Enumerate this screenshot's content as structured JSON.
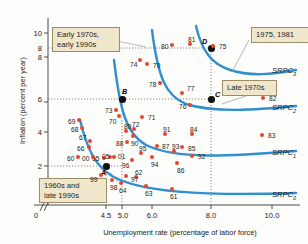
{
  "figure": {
    "title": "",
    "xaxis_title": "Unemployment rate (percentage of labor force)",
    "yaxis_title": "Inflation (percent per year)"
  },
  "callouts": [
    {
      "id": "early70s",
      "text": "Early 1970s,\nearly 1990s"
    },
    {
      "id": "years1975_1981",
      "text": "1975, 1981"
    },
    {
      "id": "late1970s",
      "text": "Late 1970s"
    },
    {
      "id": "sixties_late90s",
      "text": "1960s and\nlate 1990s"
    }
  ],
  "curve_labels": [
    {
      "name": "SRPC",
      "sub": "3"
    },
    {
      "name": "SRPC",
      "sub": "2"
    },
    {
      "name": "SRPC",
      "sub": "1"
    },
    {
      "name": "SRPC",
      "sub": "0"
    }
  ],
  "equilibrium_points": [
    {
      "label": "A",
      "x": 4.55,
      "y": 2.0
    },
    {
      "label": "B",
      "x": 5.0,
      "y": 6.1
    },
    {
      "label": "C",
      "x": 8.0,
      "y": 6.1
    },
    {
      "label": "D",
      "x": 8.0,
      "y": 8.2
    }
  ],
  "colors": {
    "point": "#e8452c",
    "curve": "#2f8fd0",
    "equilibrium": "#111111",
    "callout_bg": "#efe6cc",
    "callout_border": "#9c8f68"
  },
  "chart_data": {
    "type": "scatter",
    "title": "",
    "xlabel": "Unemployment rate (percentage of labor force)",
    "ylabel": "Inflation (percent per year)",
    "xlim": [
      4.0,
      10.6
    ],
    "ylim": [
      0.4,
      11.0
    ],
    "xticks": [
      "0",
      "4.5",
      "5.0",
      "6.0",
      "8.0",
      "10.0"
    ],
    "yticks": [
      "2",
      "4",
      "6",
      "8",
      "10"
    ],
    "grid": false,
    "axis_break": true,
    "reference_lines": {
      "horizontal": [
        2.0,
        6.1,
        8.2
      ],
      "vertical": [
        4.55,
        5.0,
        8.0
      ]
    },
    "legend": "none",
    "series": [
      {
        "name": "Year observations",
        "marker": "filled-circle",
        "color": "#e8452c",
        "points": [
          {
            "label": "60",
            "px": 78,
            "py": 157
          },
          {
            "label": "61",
            "px": 172,
            "py": 189
          },
          {
            "label": "62",
            "px": 136,
            "py": 177
          },
          {
            "label": "63",
            "px": 146,
            "py": 186
          },
          {
            "label": "64",
            "px": 121,
            "py": 183
          },
          {
            "label": "65",
            "px": 104,
            "py": 158
          },
          {
            "label": "66",
            "px": 89,
            "py": 147
          },
          {
            "label": "67",
            "px": 90,
            "py": 141
          },
          {
            "label": "68",
            "px": 82,
            "py": 128
          },
          {
            "label": "69",
            "px": 79,
            "py": 120
          },
          {
            "label": "70",
            "px": 119,
            "py": 116
          },
          {
            "label": "71",
            "px": 142,
            "py": 117
          },
          {
            "label": "72",
            "px": 134,
            "py": 129
          },
          {
            "label": "73",
            "px": 116,
            "py": 110
          },
          {
            "label": "74",
            "px": 140,
            "py": 60
          },
          {
            "label": "75",
            "px": 213,
            "py": 46
          },
          {
            "label": "76",
            "px": 190,
            "py": 105
          },
          {
            "label": "77",
            "px": 182,
            "py": 93
          },
          {
            "label": "78",
            "px": 160,
            "py": 83
          },
          {
            "label": "79",
            "px": 147,
            "py": 64
          },
          {
            "label": "80",
            "px": 172,
            "py": 45
          },
          {
            "label": "81",
            "px": 190,
            "py": 44
          },
          {
            "label": "82",
            "px": 263,
            "py": 98
          },
          {
            "label": "83",
            "px": 262,
            "py": 135
          },
          {
            "label": "84",
            "px": 192,
            "py": 134
          },
          {
            "label": "85",
            "px": 182,
            "py": 147
          },
          {
            "label": "86",
            "px": 177,
            "py": 163
          },
          {
            "label": "87",
            "px": 157,
            "py": 146
          },
          {
            "label": "88",
            "px": 127,
            "py": 142
          },
          {
            "label": "89",
            "px": 126,
            "py": 131
          },
          {
            "label": "90",
            "px": 133,
            "py": 136
          },
          {
            "label": "91",
            "px": 165,
            "py": 134
          },
          {
            "label": "92",
            "px": 192,
            "py": 156
          },
          {
            "label": "93",
            "px": 174,
            "py": 151
          },
          {
            "label": "94",
            "px": 152,
            "py": 157
          },
          {
            "label": "95",
            "px": 141,
            "py": 153
          },
          {
            "label": "96",
            "px": 132,
            "py": 160
          },
          {
            "label": "97",
            "px": 126,
            "py": 176
          },
          {
            "label": "98",
            "px": 112,
            "py": 180
          },
          {
            "label": "99",
            "px": 101,
            "py": 175
          },
          {
            "label": "00",
            "px": 93,
            "py": 157
          },
          {
            "label": "01",
            "px": 114,
            "py": 157
          },
          {
            "label": "05",
            "px": 110,
            "py": 157
          }
        ]
      }
    ]
  }
}
